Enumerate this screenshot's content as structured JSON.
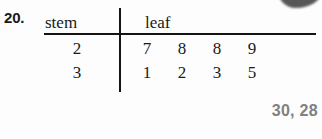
{
  "exercise": {
    "number_label": "20."
  },
  "plot": {
    "headers": {
      "stem": "stem",
      "leaf": "leaf"
    },
    "rows": [
      {
        "stem": "2",
        "leaves": [
          "7",
          "8",
          "8",
          "9"
        ]
      },
      {
        "stem": "3",
        "leaves": [
          "1",
          "2",
          "3",
          "5"
        ]
      }
    ]
  },
  "answer": {
    "text": "30, 28",
    "color": "#808080"
  },
  "colors": {
    "page_background": "#fdfdfd",
    "ink": "#1a1a1a",
    "rule": "#141414",
    "answer_gray": "#808080"
  },
  "artifacts": {
    "corner_smudge": "scan-smudge"
  }
}
